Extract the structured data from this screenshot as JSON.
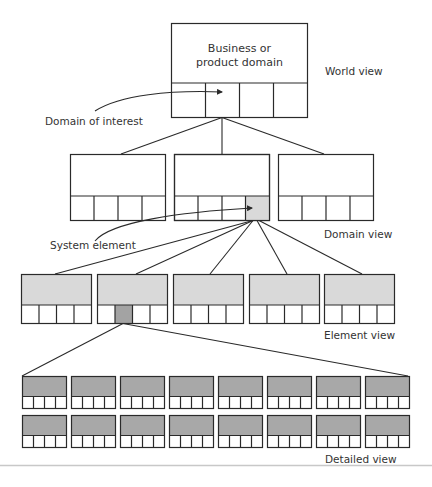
{
  "diagram": {
    "world": {
      "title_line1": "Business or",
      "title_line2": "product domain",
      "label": "World view"
    },
    "annotations": {
      "domain_of_interest": "Domain of interest",
      "system_element": "System element"
    },
    "domain_row": {
      "label": "Domain view",
      "box_count": 3,
      "highlighted_box": 2,
      "highlighted_cell": 4
    },
    "element_row": {
      "label": "Element view",
      "box_count": 5,
      "highlighted_box": 2,
      "highlighted_cell": 2
    },
    "detail_grid": {
      "label": "Detailed view",
      "rows": 2,
      "columns": 8
    },
    "colors": {
      "line": "#2a2a2a",
      "element_fill": "#d9d9d9",
      "highlight_light": "#d9d9d9",
      "highlight_dark": "#a3a3a3",
      "detail_fill": "#a8a8a8",
      "rule": "#c8c8c8"
    }
  }
}
